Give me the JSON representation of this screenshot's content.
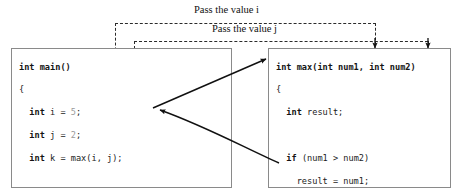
{
  "figure": {
    "background": "#ffffff",
    "ink": "#1b1b1b",
    "literal_color": "#9a9a9a",
    "box_border": "#8a8a8a",
    "dash_color": "#2b2b2b"
  },
  "labels": {
    "pass_i": "Pass the value i",
    "pass_j": "Pass the value j"
  },
  "main_function": {
    "name": "main-code-box",
    "lines": [
      [
        {
          "t": "int main()",
          "c": "kw"
        }
      ],
      [
        {
          "t": "{",
          "c": "pl"
        }
      ],
      [
        {
          "t": "  ",
          "c": "pl"
        },
        {
          "t": "int",
          "c": "kw"
        },
        {
          "t": " i = ",
          "c": "pl"
        },
        {
          "t": "5",
          "c": "lit"
        },
        {
          "t": ";",
          "c": "pl"
        }
      ],
      [
        {
          "t": "  ",
          "c": "pl"
        },
        {
          "t": "int",
          "c": "kw"
        },
        {
          "t": " j = ",
          "c": "pl"
        },
        {
          "t": "2",
          "c": "lit"
        },
        {
          "t": ";",
          "c": "pl"
        }
      ],
      [
        {
          "t": "  ",
          "c": "pl"
        },
        {
          "t": "int",
          "c": "kw"
        },
        {
          "t": " k = max(i, j);",
          "c": "pl"
        }
      ],
      [
        {
          "t": "",
          "c": "pl"
        }
      ],
      [
        {
          "t": "  ",
          "c": "pl"
        },
        {
          "t": "cout",
          "c": "kw"
        },
        {
          "t": " << ",
          "c": "pl"
        },
        {
          "t": "\"The maximum between \"",
          "c": "str"
        }
      ],
      [
        {
          "t": "    << i << ",
          "c": "pl"
        },
        {
          "t": "\" and \"",
          "c": "str"
        },
        {
          "t": " + j + ",
          "c": "pl"
        },
        {
          "t": "\" is \"",
          "c": "str"
        }
      ],
      [
        {
          "t": "    << k;",
          "c": "pl"
        }
      ],
      [
        {
          "t": "  ",
          "c": "pl"
        },
        {
          "t": "return",
          "c": "kw"
        },
        {
          "t": " ",
          "c": "pl"
        },
        {
          "t": "0",
          "c": "lit"
        },
        {
          "t": ";",
          "c": "pl"
        }
      ],
      [
        {
          "t": "}",
          "c": "pl"
        }
      ]
    ]
  },
  "max_function": {
    "name": "max-code-box",
    "lines": [
      [
        {
          "t": "int max(int num1, int num2)",
          "c": "kw"
        }
      ],
      [
        {
          "t": "{",
          "c": "pl"
        }
      ],
      [
        {
          "t": "  ",
          "c": "pl"
        },
        {
          "t": "int",
          "c": "kw"
        },
        {
          "t": " result;",
          "c": "pl"
        }
      ],
      [
        {
          "t": "",
          "c": "pl"
        }
      ],
      [
        {
          "t": "  ",
          "c": "pl"
        },
        {
          "t": "if",
          "c": "kw"
        },
        {
          "t": " (num1 > num2)",
          "c": "pl"
        }
      ],
      [
        {
          "t": "    result = num1;",
          "c": "pl"
        }
      ],
      [
        {
          "t": "  ",
          "c": "pl"
        },
        {
          "t": "else",
          "c": "kw"
        }
      ],
      [
        {
          "t": "    result = num2;",
          "c": "pl"
        }
      ],
      [
        {
          "t": "",
          "c": "pl"
        }
      ],
      [
        {
          "t": "  ",
          "c": "pl"
        },
        {
          "t": "return",
          "c": "kw"
        },
        {
          "t": " result;",
          "c": "pl"
        }
      ],
      [
        {
          "t": "}",
          "c": "pl"
        }
      ]
    ]
  },
  "connectors": {
    "call_arrow": "solid arrow from max(i, j) call to int max header",
    "return_arrow": "curved solid arrow from return result back to max(i, j) call",
    "dashed_i": "dashed path carrying value i to num1 parameter",
    "dashed_j": "dashed path carrying value j to num2 parameter"
  }
}
